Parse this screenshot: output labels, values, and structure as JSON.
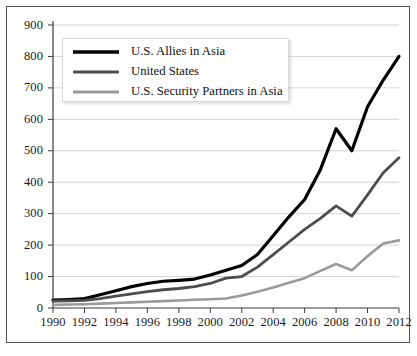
{
  "chart_data": {
    "type": "line",
    "title": "",
    "xlabel": "",
    "ylabel": "",
    "x": [
      1990,
      1991,
      1992,
      1993,
      1994,
      1995,
      1996,
      1997,
      1998,
      1999,
      2000,
      2001,
      2002,
      2003,
      2004,
      2005,
      2006,
      2007,
      2008,
      2009,
      2010,
      2011,
      2012
    ],
    "xlim": [
      1990,
      2012
    ],
    "ylim": [
      0,
      900
    ],
    "xticks": [
      1990,
      1992,
      1994,
      1996,
      1998,
      2000,
      2002,
      2004,
      2006,
      2008,
      2010,
      2012
    ],
    "yticks": [
      0,
      100,
      200,
      300,
      400,
      500,
      600,
      700,
      800,
      900
    ],
    "xtick_labels": [
      "1990",
      "1992",
      "1994",
      "1996",
      "1998",
      "2000",
      "2002",
      "2004",
      "2006",
      "2008",
      "2010",
      "2012"
    ],
    "ytick_labels": [
      "0",
      "100",
      "200",
      "300",
      "400",
      "500",
      "600",
      "700",
      "800",
      "900"
    ],
    "grid": true,
    "grid_axis": "y",
    "legend_position": "upper left",
    "series": [
      {
        "name": "U.S. Allies in Asia",
        "color": "#000000",
        "width": 3.2,
        "values": [
          25,
          27,
          30,
          42,
          55,
          68,
          78,
          85,
          88,
          92,
          105,
          120,
          135,
          170,
          230,
          290,
          345,
          440,
          570,
          500,
          640,
          725,
          800
        ]
      },
      {
        "name": "United States",
        "color": "#4d4d4d",
        "width": 2.8,
        "values": [
          22,
          23,
          24,
          30,
          38,
          45,
          52,
          58,
          62,
          68,
          78,
          95,
          100,
          130,
          170,
          210,
          250,
          285,
          325,
          292,
          360,
          430,
          478
        ]
      },
      {
        "name": "U.S. Security Partners in Asia",
        "color": "#9a9a9a",
        "width": 2.6,
        "values": [
          10,
          11,
          12,
          14,
          16,
          18,
          20,
          22,
          24,
          26,
          28,
          30,
          40,
          52,
          65,
          80,
          95,
          118,
          140,
          120,
          165,
          205,
          215
        ]
      }
    ]
  },
  "legend": {
    "items": [
      {
        "label": "U.S. Allies in Asia"
      },
      {
        "label": "United States"
      },
      {
        "label": "U.S. Security Partners in Asia"
      }
    ]
  }
}
